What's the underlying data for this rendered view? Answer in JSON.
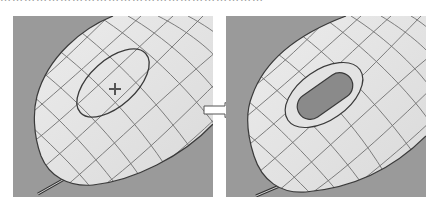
{
  "figure": {
    "caption_clipped": "…………………………………………………………",
    "colors": {
      "background": "#ffffff",
      "viewport_bg": "#9a9a9a",
      "surface": "#e6e6e6",
      "grid_line": "#6e6e6e",
      "outline": "#3a3a3a",
      "slot_fill": "#8a8a8a",
      "arrow_fill": "#ffffff",
      "arrow_stroke": "#555555"
    },
    "panels": [
      {
        "id": "before",
        "description": "Mouse shell surface with sketched ellipse and center cross marker",
        "elements": [
          "wireframe-surface",
          "ellipse-sketch",
          "center-cross",
          "cable"
        ]
      },
      {
        "id": "after",
        "description": "Mouse shell surface with recessed oval slot and offset outline",
        "elements": [
          "wireframe-surface",
          "offset-ellipse",
          "recessed-slot",
          "cable"
        ]
      }
    ],
    "arrow": {
      "direction": "right",
      "meaning": "transforms-to"
    }
  }
}
